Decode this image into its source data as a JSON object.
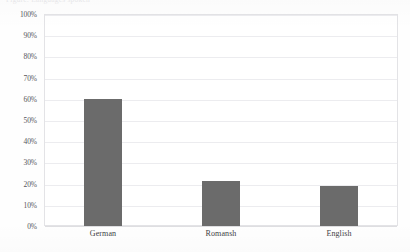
{
  "caption": {
    "clipped_top_text": "Figure: Languages spoken"
  },
  "chart_data": {
    "type": "bar",
    "title": "",
    "xlabel": "",
    "ylabel": "",
    "categories": [
      "German",
      "Romansh",
      "English"
    ],
    "values": [
      60,
      21,
      19
    ],
    "ylim": [
      0,
      100
    ],
    "ytick_labels": [
      "100%",
      "90%",
      "80%",
      "70%",
      "60%",
      "50%",
      "40%",
      "30%",
      "20%",
      "10%",
      "0%"
    ],
    "ytick_values": [
      100,
      90,
      80,
      70,
      60,
      50,
      40,
      30,
      20,
      10,
      0
    ],
    "value_suffix": "%",
    "grid": true,
    "legend": "none",
    "colors": {
      "bar": "#6b6b6b",
      "gridline": "#ececef",
      "frame": "#e3e3e6",
      "tick_label": "#55555b",
      "category_label": "#3f3f45",
      "background": "#ffffff"
    }
  }
}
